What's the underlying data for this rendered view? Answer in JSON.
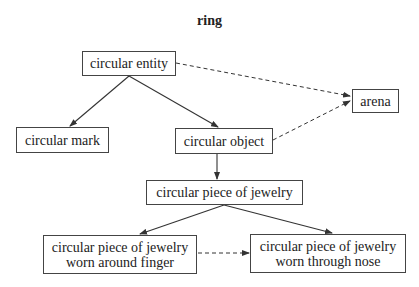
{
  "title": "ring",
  "nodes": [
    {
      "id": "circular-entity",
      "lines": [
        "circular entity"
      ],
      "x": 82,
      "y": 51,
      "w": 94,
      "h": 25
    },
    {
      "id": "arena",
      "lines": [
        "arena"
      ],
      "x": 352,
      "y": 89,
      "w": 47,
      "h": 24
    },
    {
      "id": "circular-mark",
      "lines": [
        "circular mark"
      ],
      "x": 16,
      "y": 127,
      "w": 93,
      "h": 26
    },
    {
      "id": "circular-object",
      "lines": [
        "circular object"
      ],
      "x": 175,
      "y": 128,
      "w": 98,
      "h": 26
    },
    {
      "id": "circular-piece-of-jewelry",
      "lines": [
        "circular piece of jewelry"
      ],
      "x": 146,
      "y": 180,
      "w": 157,
      "h": 25
    },
    {
      "id": "jewelry-finger",
      "lines": [
        "circular piece of jewelry",
        "worn around finger"
      ],
      "x": 43,
      "y": 235,
      "w": 154,
      "h": 39
    },
    {
      "id": "jewelry-nose",
      "lines": [
        "circular piece of jewelry",
        "worn through nose"
      ],
      "x": 250,
      "y": 234,
      "w": 156,
      "h": 39
    }
  ],
  "edges": [
    {
      "from": "circular-entity",
      "to": "circular-mark",
      "style": "solid"
    },
    {
      "from": "circular-entity",
      "to": "circular-object",
      "style": "solid"
    },
    {
      "from": "circular-object",
      "to": "circular-piece-of-jewelry",
      "style": "solid"
    },
    {
      "from": "circular-piece-of-jewelry",
      "to": "jewelry-finger",
      "style": "solid"
    },
    {
      "from": "circular-piece-of-jewelry",
      "to": "jewelry-nose",
      "style": "solid"
    },
    {
      "from": "circular-entity",
      "to": "arena",
      "style": "dashed"
    },
    {
      "from": "circular-object",
      "to": "arena",
      "style": "dashed"
    },
    {
      "from": "jewelry-finger",
      "to": "jewelry-nose",
      "style": "dashed"
    }
  ]
}
